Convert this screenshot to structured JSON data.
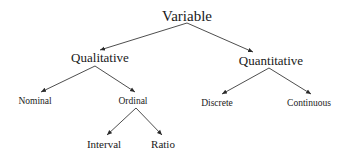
{
  "diagram": {
    "type": "tree",
    "root": {
      "label": "Variable",
      "children": [
        {
          "label": "Qualitative",
          "children": [
            {
              "label": "Nominal"
            },
            {
              "label": "Ordinal",
              "children": [
                {
                  "label": "Interval"
                },
                {
                  "label": "Ratio"
                }
              ]
            }
          ]
        },
        {
          "label": "Quantitative",
          "children": [
            {
              "label": "Discrete"
            },
            {
              "label": "Continuous"
            }
          ]
        }
      ]
    },
    "nodes": {
      "variable": "Variable",
      "qualitative": "Qualitative",
      "quantitative": "Quantitative",
      "nominal": "Nominal",
      "ordinal": "Ordinal",
      "discrete": "Discrete",
      "continuous": "Continuous",
      "interval": "Interval",
      "ratio": "Ratio"
    },
    "edges": [
      [
        "Variable",
        "Qualitative"
      ],
      [
        "Variable",
        "Quantitative"
      ],
      [
        "Qualitative",
        "Nominal"
      ],
      [
        "Qualitative",
        "Ordinal"
      ],
      [
        "Quantitative",
        "Discrete"
      ],
      [
        "Quantitative",
        "Continuous"
      ],
      [
        "Ordinal",
        "Interval"
      ],
      [
        "Ordinal",
        "Ratio"
      ]
    ],
    "colors": {
      "text": "#1a1a1a",
      "edge": "#3a3a3a",
      "background": "#ffffff"
    }
  }
}
